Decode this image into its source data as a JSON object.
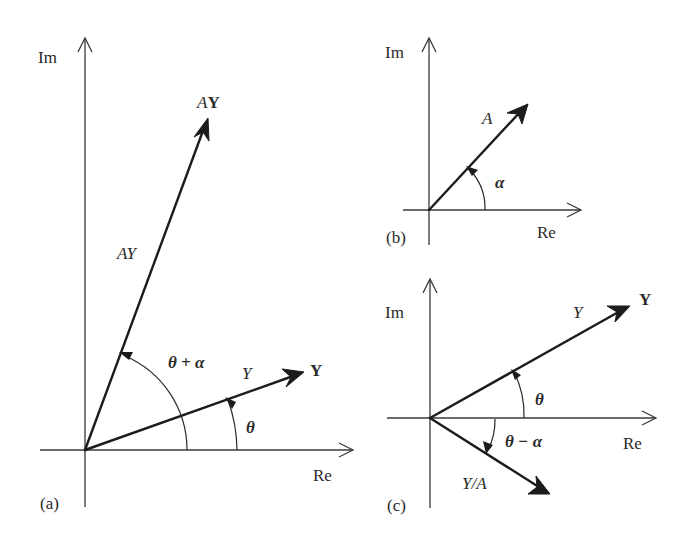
{
  "figure": {
    "panels": [
      {
        "id": "a",
        "caption": "(a)",
        "axes": {
          "im_label": "Im",
          "re_label": "Re"
        },
        "vectors": [
          {
            "name": "AY",
            "magnitude_label": "AY",
            "phasor_label_prefix": "A",
            "phasor_label_bold": "Y"
          },
          {
            "name": "Y",
            "magnitude_label": "Y",
            "phasor_label_bold": "Y"
          }
        ],
        "angles": [
          {
            "name": "theta-plus-alpha",
            "label": "θ + α"
          },
          {
            "name": "theta",
            "label": "θ"
          }
        ]
      },
      {
        "id": "b",
        "caption": "(b)",
        "axes": {
          "im_label": "Im",
          "re_label": "Re"
        },
        "vectors": [
          {
            "name": "A",
            "magnitude_label": "A"
          }
        ],
        "angles": [
          {
            "name": "alpha",
            "label": "α"
          }
        ]
      },
      {
        "id": "c",
        "caption": "(c)",
        "axes": {
          "im_label": "Im",
          "re_label": "Re"
        },
        "vectors": [
          {
            "name": "Y",
            "magnitude_label": "Y",
            "phasor_label_bold": "Y"
          },
          {
            "name": "Y-over-A",
            "magnitude_label": "Y/A"
          }
        ],
        "angles": [
          {
            "name": "theta",
            "label": "θ"
          },
          {
            "name": "theta-minus-alpha",
            "label": "θ − α"
          }
        ]
      }
    ]
  }
}
